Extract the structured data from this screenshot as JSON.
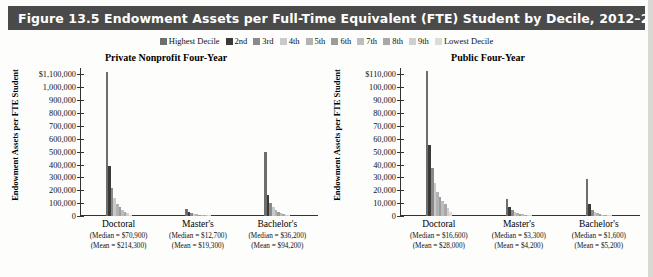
{
  "figure": {
    "title": "Figure 13.5  Endowment Assets per Full-Time Equivalent (FTE) Student by Decile, 2012–2013",
    "header_color": "#4a4a4a",
    "background": "#fdfdfb"
  },
  "legend": {
    "position": "top-center",
    "items": [
      {
        "label": "Highest Decile",
        "color": "#6e6e6e"
      },
      {
        "label": "2nd",
        "color": "#3a3a3a"
      },
      {
        "label": "3rd",
        "color": "#8a8a8a"
      },
      {
        "label": "4th",
        "color": "#c9c9c9"
      },
      {
        "label": "5th",
        "color": "#b2b2b2"
      },
      {
        "label": "6th",
        "color": "#9c9c9c"
      },
      {
        "label": "7th",
        "color": "#bdbdbd"
      },
      {
        "label": "8th",
        "color": "#a8a8a8"
      },
      {
        "label": "9th",
        "color": "#cfcfcf"
      },
      {
        "label": "Lowest Decile",
        "color": "#dcdcdc"
      }
    ]
  },
  "chart_data": [
    {
      "type": "bar",
      "title": "Private Nonprofit Four-Year",
      "xlabel": "",
      "ylabel": "Endowment Assets per FTE Student",
      "ylim": [
        0,
        1150000
      ],
      "grid": false,
      "legend_position": "top-center",
      "ytick_labels": [
        "$1,100,000",
        "1,000,000",
        "900,000",
        "800,000",
        "700,000",
        "600,000",
        "500,000",
        "400,000",
        "300,000",
        "200,000",
        "100,000",
        "0"
      ],
      "ytick_values": [
        1100000,
        1000000,
        900000,
        800000,
        700000,
        600000,
        500000,
        400000,
        300000,
        200000,
        100000,
        0
      ],
      "categories": [
        "Doctoral",
        "Master's",
        "Bachelor's"
      ],
      "annotations": [
        {
          "category": "Doctoral",
          "median": "(Median = $70,900)",
          "mean": "(Mean = $214,300)"
        },
        {
          "category": "Master's",
          "median": "(Median = $12,700)",
          "mean": "(Mean = $19,300)"
        },
        {
          "category": "Bachelor's",
          "median": "(Median = $36,200)",
          "mean": "(Mean = $94,200)"
        }
      ],
      "series": [
        {
          "name": "Highest Decile",
          "values": [
            1120000,
            55000,
            500000
          ]
        },
        {
          "name": "2nd",
          "values": [
            390000,
            30000,
            160000
          ]
        },
        {
          "name": "3rd",
          "values": [
            215000,
            22000,
            105000
          ]
        },
        {
          "name": "4th",
          "values": [
            140000,
            16000,
            70000
          ]
        },
        {
          "name": "5th",
          "values": [
            95000,
            12000,
            50000
          ]
        },
        {
          "name": "6th",
          "values": [
            70000,
            9000,
            35000
          ]
        },
        {
          "name": "7th",
          "values": [
            50000,
            6500,
            25000
          ]
        },
        {
          "name": "8th",
          "values": [
            35000,
            4500,
            16000
          ]
        },
        {
          "name": "9th",
          "values": [
            22000,
            3000,
            9000
          ]
        },
        {
          "name": "Lowest Decile",
          "values": [
            10000,
            1500,
            3000
          ]
        }
      ]
    },
    {
      "type": "bar",
      "title": "Public Four-Year",
      "xlabel": "",
      "ylabel": "Endowment Assets per FTE Student",
      "ylim": [
        0,
        115000
      ],
      "grid": false,
      "legend_position": "top-center",
      "ytick_labels": [
        "$110,000",
        "100,000",
        "90,000",
        "80,000",
        "70,000",
        "60,000",
        "50,000",
        "40,000",
        "30,000",
        "20,000",
        "10,000",
        "0"
      ],
      "ytick_values": [
        110000,
        100000,
        90000,
        80000,
        70000,
        60000,
        50000,
        40000,
        30000,
        20000,
        10000,
        0
      ],
      "categories": [
        "Doctoral",
        "Master's",
        "Bachelor's"
      ],
      "annotations": [
        {
          "category": "Doctoral",
          "median": "(Median = $16,600)",
          "mean": "(Mean = $28,000)"
        },
        {
          "category": "Master's",
          "median": "(Median = $3,300)",
          "mean": "(Mean = $4,200)"
        },
        {
          "category": "Bachelor's",
          "median": "(Median = $1,600)",
          "mean": "(Mean = $5,200)"
        }
      ],
      "series": [
        {
          "name": "Highest Decile",
          "values": [
            113000,
            13000,
            29000
          ]
        },
        {
          "name": "2nd",
          "values": [
            55000,
            7000,
            9000
          ]
        },
        {
          "name": "3rd",
          "values": [
            37000,
            4500,
            5000
          ]
        },
        {
          "name": "4th",
          "values": [
            26000,
            3300,
            3000
          ]
        },
        {
          "name": "5th",
          "values": [
            19000,
            2500,
            2000
          ]
        },
        {
          "name": "6th",
          "values": [
            15000,
            1900,
            1400
          ]
        },
        {
          "name": "7th",
          "values": [
            12000,
            1400,
            1000
          ]
        },
        {
          "name": "8th",
          "values": [
            9000,
            1000,
            700
          ]
        },
        {
          "name": "9th",
          "values": [
            6000,
            600,
            400
          ]
        },
        {
          "name": "Lowest Decile",
          "values": [
            3000,
            300,
            150
          ]
        }
      ]
    }
  ]
}
